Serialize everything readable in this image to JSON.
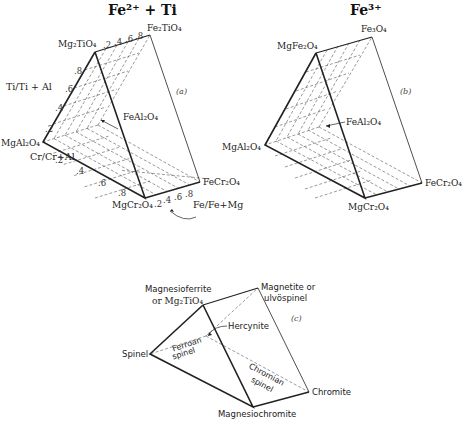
{
  "figure": {
    "panel_a": {
      "title": "Fe²⁺ + Ti",
      "tag": "(a)",
      "vertices": {
        "top_front": "Mg₂TiO₄",
        "top_back": "Fe₂TiO₄",
        "left": "MgAl₂O₄",
        "bottom_front": "MgCr₂O₄",
        "bottom_back": "FeCr₂O₄",
        "hidden": "FeAl₂O₄"
      },
      "axes": {
        "ti": {
          "label": "Ti/Ti + Al",
          "ticks": [
            ".2",
            ".4",
            ".6",
            ".8"
          ]
        },
        "cr": {
          "label": "Cr/Cr+Al",
          "ticks": [
            ".2",
            ".4",
            ".6",
            ".8"
          ]
        },
        "fe_top": {
          "ticks": [
            ".2",
            ".4",
            ".6",
            ".8"
          ]
        },
        "fe_bottom": {
          "label": "Fe/Fe+Mg",
          "ticks": [
            ".2",
            ".4",
            ".6",
            ".8"
          ]
        }
      }
    },
    "panel_b": {
      "title": "Fe³⁺",
      "tag": "(b)",
      "vertices": {
        "top_front": "MgFe₂O₄",
        "top_back": "Fe₃O₄",
        "left": "MgAl₂O₄",
        "bottom_front": "MgCr₂O₄",
        "bottom_back": "FeCr₂O₄",
        "hidden": "FeAl₂O₄"
      }
    },
    "panel_c": {
      "tag": "(c)",
      "vertices": {
        "top_front_line1": "Magnesioferrite",
        "top_front_line2": "or Mg₂TiO₄",
        "top_back_line1": "Magnetite or",
        "top_back_line2": "ulvöspinel",
        "left": "Spinel",
        "bottom_front": "Magnesiochromite",
        "bottom_back": "Chromite",
        "hidden": "Hercynite"
      },
      "regions": {
        "ferroan_line1": "Ferroan",
        "ferroan_line2": "spinel",
        "chromian_line1": "Chromian",
        "chromian_line2": "spinel"
      }
    }
  }
}
